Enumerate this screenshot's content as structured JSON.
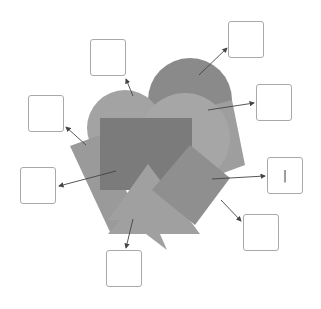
{
  "diagram": {
    "type": "labeling-exercise",
    "colors": {
      "background": "#ffffff",
      "box_border": "#a9a9a9",
      "arrow": "#444444",
      "circle_back": "#8a8a8a",
      "circle_left": "#a3a3a3",
      "circle_right": "#a6a6a6",
      "rotated_rect_right": "#979797",
      "parallelogram_left": "#9a9a9a",
      "dark_rect": "#7b7b7b",
      "triangle": "#a0a0a0",
      "diamond": "#8f8f8f",
      "tilted_rect_back": "#9e9e9e"
    },
    "labels": [
      {
        "id": "A",
        "text": "",
        "target": "left-circle"
      },
      {
        "id": "B",
        "text": "",
        "target": "left-parallelogram"
      },
      {
        "id": "C",
        "text": "",
        "target": "dark-rectangle"
      },
      {
        "id": "D",
        "text": "",
        "target": "back-circle"
      },
      {
        "id": "E",
        "text": "",
        "target": "right-circle"
      },
      {
        "id": "F",
        "text": "|",
        "target": "diamond-square"
      },
      {
        "id": "G",
        "text": "",
        "target": "diamond-corner"
      },
      {
        "id": "H",
        "text": "",
        "target": "triangle"
      }
    ]
  }
}
